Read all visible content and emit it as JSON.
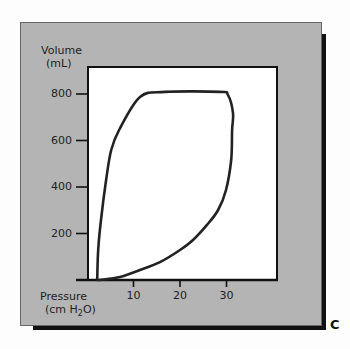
{
  "figure_label": "C",
  "chart_data": {
    "type": "line",
    "title": "",
    "xlabel": "Pressure (cm H2O)",
    "xlabel_line1": "Pressure",
    "xlabel_line2_prefix": "(cm H",
    "xlabel_line2_sub": "2",
    "xlabel_line2_suffix": "O)",
    "ylabel": "Volume (mL)",
    "ylabel_line1": "Volume",
    "ylabel_line2": "(mL)",
    "xlim": [
      0,
      41
    ],
    "ylim": [
      0,
      800
    ],
    "x_ticks": [
      10,
      20,
      30
    ],
    "x_tick_labels": [
      "10",
      "20",
      "30"
    ],
    "y_ticks": [
      200,
      400,
      600,
      800
    ],
    "y_tick_labels": [
      "200",
      "400",
      "600",
      "800"
    ],
    "grid": false,
    "legend": null,
    "series": [
      {
        "name": "Pressure-volume loop",
        "closed": true,
        "points": [
          [
            2.2,
            0
          ],
          [
            2.4,
            129
          ],
          [
            3.0,
            258
          ],
          [
            4.1,
            430
          ],
          [
            5.2,
            559
          ],
          [
            6.9,
            645
          ],
          [
            11.4,
            787
          ],
          [
            16.8,
            809
          ],
          [
            28.6,
            809
          ],
          [
            30.3,
            796
          ],
          [
            31.4,
            718
          ],
          [
            31.2,
            645
          ],
          [
            31.0,
            516
          ],
          [
            29.9,
            387
          ],
          [
            28.2,
            301
          ],
          [
            25.8,
            237
          ],
          [
            22.8,
            172
          ],
          [
            20.0,
            129
          ],
          [
            15.7,
            77
          ],
          [
            11.4,
            43
          ],
          [
            7.1,
            13
          ],
          [
            2.8,
            0
          ]
        ]
      }
    ]
  },
  "colors": {
    "panel": "#b4b4b4",
    "plot_bg": "#ffffff",
    "line": "#222222",
    "shadow": "#111111"
  }
}
